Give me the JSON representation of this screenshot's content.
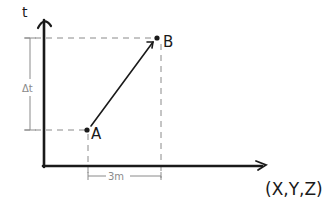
{
  "diagram": {
    "type": "spacetime-displacement-sketch",
    "axes": {
      "vertical_label": "t",
      "horizontal_label": "(X,Y,Z)"
    },
    "points": [
      {
        "id": "A",
        "label": "A"
      },
      {
        "id": "B",
        "label": "B"
      }
    ],
    "annotations": {
      "time_interval": "Δt",
      "spatial_distance": "3m"
    },
    "colors": {
      "ink": "#1a1a1a",
      "guide": "#8a8a8a",
      "background": "#ffffff"
    }
  }
}
